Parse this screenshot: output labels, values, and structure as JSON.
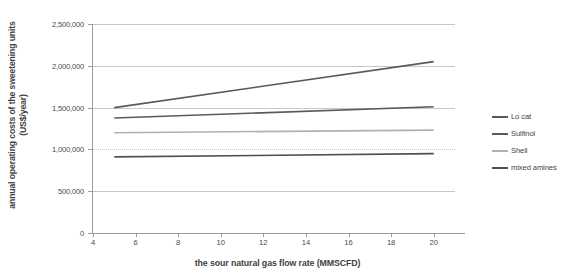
{
  "chart_data": {
    "type": "line",
    "title": "",
    "xlabel": "the sour natural gas flow rate (MMSCFD)",
    "ylabel": "annual operating costs of the sweetening units (US$/year)",
    "xlim": [
      4,
      21
    ],
    "ylim": [
      0,
      2500000
    ],
    "xticks": [
      4,
      6,
      8,
      10,
      12,
      14,
      16,
      18,
      20
    ],
    "xticklabels": [
      "4",
      "6",
      "8",
      "10",
      "12",
      "14",
      "16",
      "18",
      "20"
    ],
    "yticks": [
      0,
      500000,
      1000000,
      1500000,
      2000000,
      2500000
    ],
    "yticklabels": [
      "0",
      "500,000",
      "1,000,000",
      "1,500,000",
      "2,000,000",
      "2,500,000"
    ],
    "grid": true,
    "legend_position": "right",
    "x": [
      5,
      20
    ],
    "series": [
      {
        "name": "Lo cat",
        "values": [
          1500000,
          2050000
        ],
        "color": "#595959"
      },
      {
        "name": "Sulfinol",
        "values": [
          1375000,
          1510000
        ],
        "color": "#5a5a5a"
      },
      {
        "name": "Shell",
        "values": [
          1200000,
          1230000
        ],
        "color": "#b0b0b0"
      },
      {
        "name": "mixed amines",
        "values": [
          910000,
          950000
        ],
        "color": "#4f4f4f"
      }
    ]
  },
  "legend": {
    "items": [
      {
        "label": "Lo cat"
      },
      {
        "label": "Sulfinol"
      },
      {
        "label": "Shell"
      },
      {
        "label": "mixed amines"
      }
    ]
  },
  "axes": {
    "x_title": "the sour natural gas flow rate (MMSCFD)",
    "y_title": "annual operating costs of the sweetening units (US$/year)"
  }
}
